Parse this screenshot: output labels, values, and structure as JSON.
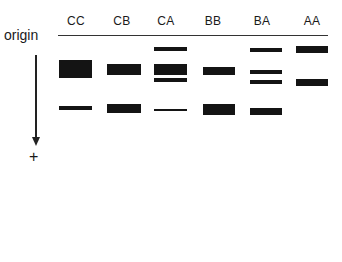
{
  "diagram": {
    "type": "gel_electrophoresis",
    "origin_label": "origin",
    "direction_label": "+",
    "lanes": [
      {
        "label": "CC",
        "center_x": 76,
        "bands": [
          {
            "y": 60,
            "h": 18,
            "x": 59,
            "w": 33
          },
          {
            "y": 106,
            "h": 4,
            "x": 59,
            "w": 33
          }
        ]
      },
      {
        "label": "CB",
        "center_x": 122,
        "bands": [
          {
            "y": 64,
            "h": 11,
            "x": 107,
            "w": 34
          },
          {
            "y": 104,
            "h": 9,
            "x": 107,
            "w": 34
          }
        ]
      },
      {
        "label": "CA",
        "center_x": 166,
        "bands": [
          {
            "y": 47,
            "h": 4,
            "x": 154,
            "w": 33
          },
          {
            "y": 64,
            "h": 11,
            "x": 154,
            "w": 33
          },
          {
            "y": 78,
            "h": 4,
            "x": 154,
            "w": 33
          },
          {
            "y": 109,
            "h": 2,
            "x": 154,
            "w": 33
          }
        ]
      },
      {
        "label": "BB",
        "center_x": 213,
        "bands": [
          {
            "y": 67,
            "h": 8,
            "x": 203,
            "w": 32
          },
          {
            "y": 104,
            "h": 11,
            "x": 203,
            "w": 32
          }
        ]
      },
      {
        "label": "BA",
        "center_x": 262,
        "bands": [
          {
            "y": 48,
            "h": 4,
            "x": 250,
            "w": 32
          },
          {
            "y": 70,
            "h": 4,
            "x": 250,
            "w": 32
          },
          {
            "y": 80,
            "h": 4,
            "x": 250,
            "w": 32
          },
          {
            "y": 108,
            "h": 7,
            "x": 250,
            "w": 32
          }
        ]
      },
      {
        "label": "AA",
        "center_x": 312,
        "bands": [
          {
            "y": 46,
            "h": 7,
            "x": 296,
            "w": 32
          },
          {
            "y": 79,
            "h": 7,
            "x": 296,
            "w": 32
          }
        ]
      }
    ],
    "colors": {
      "band": "#141414",
      "line": "#333333",
      "text": "#1a1a1a"
    }
  }
}
